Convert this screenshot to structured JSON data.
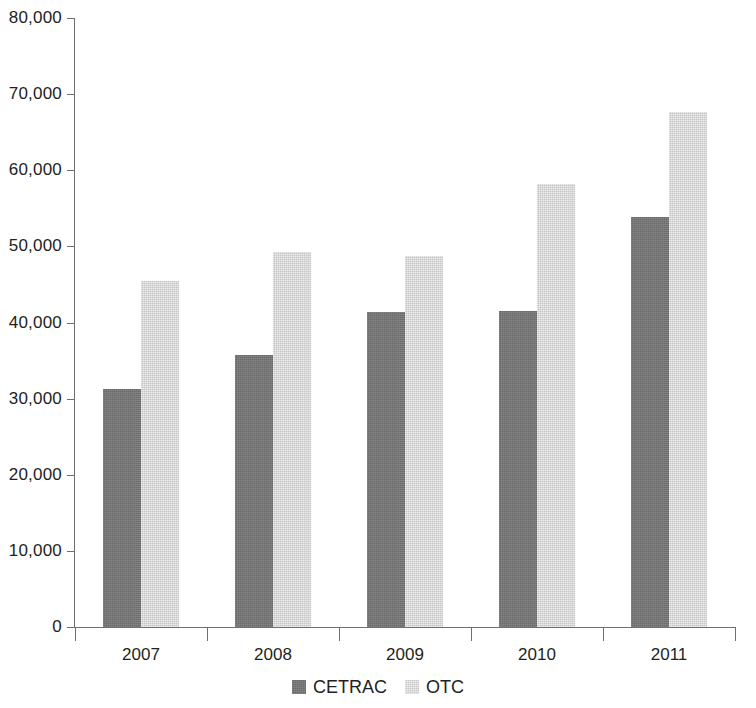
{
  "chart_data": {
    "type": "bar",
    "title": "",
    "subtitle": "",
    "xlabel": "",
    "ylabel": "",
    "categories": [
      "2007",
      "2008",
      "2009",
      "2010",
      "2011"
    ],
    "series": [
      {
        "name": "CETRAC",
        "color": "#767676",
        "values": [
          31300,
          35700,
          41400,
          41500,
          53900
        ]
      },
      {
        "name": "OTC",
        "color": "#d6d6d6",
        "values": [
          45400,
          49200,
          48800,
          58200,
          67700
        ]
      }
    ],
    "ylim": [
      0,
      80000
    ],
    "y_ticks": [
      0,
      10000,
      20000,
      30000,
      40000,
      50000,
      60000,
      70000,
      80000
    ],
    "y_tick_labels": [
      "0",
      "10,000",
      "20,000",
      "30,000",
      "40,000",
      "50,000",
      "60,000",
      "70,000",
      "80,000"
    ],
    "grid": false,
    "legend_position": "bottom",
    "legend": [
      "CETRAC",
      "OTC"
    ]
  }
}
